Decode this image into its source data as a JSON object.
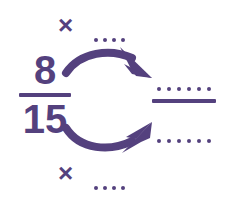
{
  "diagram": {
    "accent_color": "#54417e",
    "background_color": "#ffffff",
    "source_fraction": {
      "numerator": "8",
      "denominator": "15"
    },
    "operators": {
      "multiply_top": "×",
      "multiply_bottom": "×"
    },
    "blanks": {
      "top_factor_dots": 4,
      "bottom_factor_dots": 4,
      "result_numerator_dots": 6,
      "result_denominator_dots": 6
    },
    "arrows": {
      "top": "curved-arrow-right-from-numerator",
      "bottom": "curved-arrow-right-from-denominator"
    }
  }
}
